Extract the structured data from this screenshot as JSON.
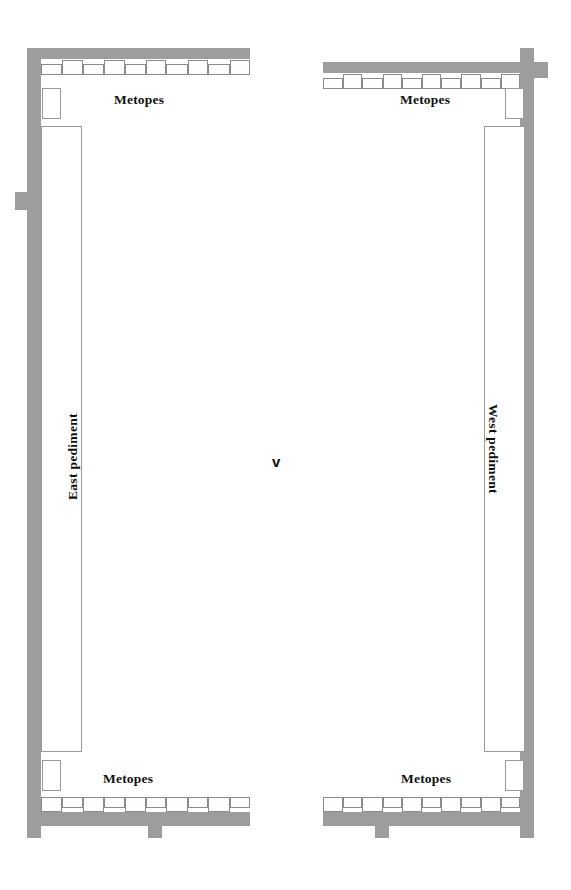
{
  "figure": {
    "kind": "architectural-floor-plan",
    "title_visible": false,
    "center_marker": "v",
    "colors": {
      "wall_fill": "#9d9d9d",
      "background": "#ffffff",
      "outline": "#8c8c8c",
      "text": "#111111"
    }
  },
  "labels": {
    "metopes_top_left": "Metopes",
    "metopes_top_right": "Metopes",
    "metopes_bottom_left": "Metopes",
    "metopes_bottom_right": "Metopes",
    "east_pediment": "East pediment",
    "west_pediment": "West pediment",
    "center": "v"
  },
  "left_structure": {
    "name": "east-half-plan",
    "walls": {
      "vertical_outer": {
        "x": 27,
        "y": 48,
        "w": 14,
        "h": 790
      },
      "top_band": {
        "x": 41,
        "y": 48,
        "w": 209,
        "h": 11
      },
      "bottom_band": {
        "x": 27,
        "y": 812,
        "w": 223,
        "h": 14
      },
      "side_tab": {
        "x": 15,
        "y": 192,
        "w": 12,
        "h": 18
      },
      "bottom_tab_left": {
        "x": 27,
        "y": 826,
        "w": 14,
        "h": 12
      },
      "bottom_tab_mid": {
        "x": 148,
        "y": 826,
        "w": 14,
        "h": 12
      }
    },
    "rooms": {
      "top_small": {
        "x": 42,
        "y": 88,
        "w": 19,
        "h": 31
      },
      "long_cella": {
        "x": 41,
        "y": 126,
        "w": 41,
        "h": 626
      },
      "bottom_small": {
        "x": 42,
        "y": 760,
        "w": 19,
        "h": 31
      }
    },
    "frieze_top": {
      "x": 41,
      "y": 60,
      "blocks": 10
    },
    "frieze_bottom": {
      "x": 41,
      "y": 798,
      "blocks": 10
    }
  },
  "right_structure": {
    "name": "west-half-plan",
    "walls": {
      "vertical_outer": {
        "x": 520,
        "y": 48,
        "w": 14,
        "h": 790
      },
      "top_band": {
        "x": 323,
        "y": 62,
        "w": 197,
        "h": 11
      },
      "bottom_band": {
        "x": 323,
        "y": 812,
        "w": 211,
        "h": 14
      },
      "side_tab": {
        "x": 534,
        "y": 62,
        "w": 14,
        "h": 16
      },
      "bottom_tab_right": {
        "x": 520,
        "y": 826,
        "w": 14,
        "h": 12
      },
      "bottom_tab_mid": {
        "x": 375,
        "y": 826,
        "w": 14,
        "h": 12
      }
    },
    "rooms": {
      "top_small": {
        "x": 505,
        "y": 88,
        "w": 19,
        "h": 31
      },
      "long_cella": {
        "x": 484,
        "y": 126,
        "w": 41,
        "h": 626
      },
      "bottom_small": {
        "x": 505,
        "y": 760,
        "w": 19,
        "h": 31
      }
    },
    "frieze_top": {
      "x": 323,
      "y": 74,
      "blocks": 10
    },
    "frieze_bottom": {
      "x": 323,
      "y": 798,
      "blocks": 10
    }
  },
  "metope_blocks": {
    "count_per_run": 10,
    "widths": [
      22,
      21,
      22,
      21,
      22,
      21,
      22,
      21,
      22,
      21
    ],
    "pattern": "alternating triglyph/metope",
    "note": "blocks alternate higher/lower along the frieze strip"
  }
}
